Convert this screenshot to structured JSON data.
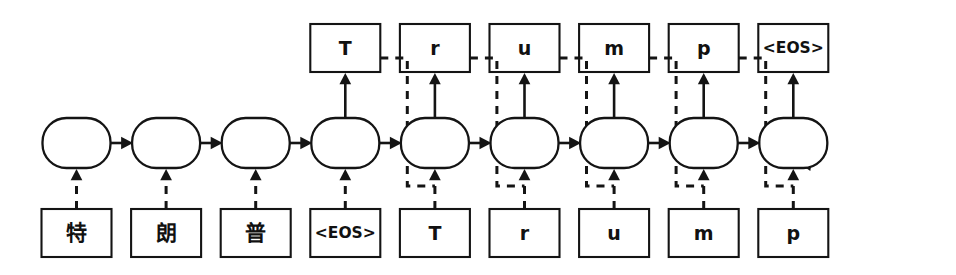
{
  "diagram": {
    "canvas": {
      "width": 956,
      "height": 275,
      "background": "#ffffff"
    },
    "ink_color": "#141414",
    "columns": 9,
    "encoder_steps": 4,
    "decoder_steps": 5,
    "input_row": {
      "role": "input-tokens",
      "tokens": [
        {
          "text": "特",
          "kind": "cjk"
        },
        {
          "text": "朗",
          "kind": "cjk"
        },
        {
          "text": "普",
          "kind": "cjk"
        },
        {
          "text": "<EOS>",
          "kind": "eos"
        },
        {
          "text": "T",
          "kind": "latin"
        },
        {
          "text": "r",
          "kind": "latin"
        },
        {
          "text": "u",
          "kind": "latin"
        },
        {
          "text": "m",
          "kind": "latin"
        },
        {
          "text": "p",
          "kind": "latin"
        }
      ]
    },
    "output_row": {
      "role": "output-tokens",
      "first_column_index": 3,
      "tokens": [
        {
          "text": "T",
          "kind": "latin",
          "column": 3
        },
        {
          "text": "r",
          "kind": "latin",
          "column": 4
        },
        {
          "text": "u",
          "kind": "latin",
          "column": 5
        },
        {
          "text": "m",
          "kind": "latin",
          "column": 6
        },
        {
          "text": "p",
          "kind": "latin",
          "column": 7
        },
        {
          "text": "<EOS>",
          "kind": "eos",
          "column": 8
        }
      ]
    },
    "cell_row": {
      "role": "rnn-hidden-cells",
      "count": 9,
      "labels": [
        "",
        "",
        "",
        "",
        "",
        "",
        "",
        "",
        ""
      ]
    },
    "edges": {
      "input_to_cell": "dashed-arrow-up",
      "cell_to_cell": "solid-arrow-right",
      "cell_to_output": "solid-arrow-up",
      "output_feedback": "dashed-arrow-to-next-cell-input",
      "self_loop": "dashed-arrow-into-last-cell"
    }
  }
}
